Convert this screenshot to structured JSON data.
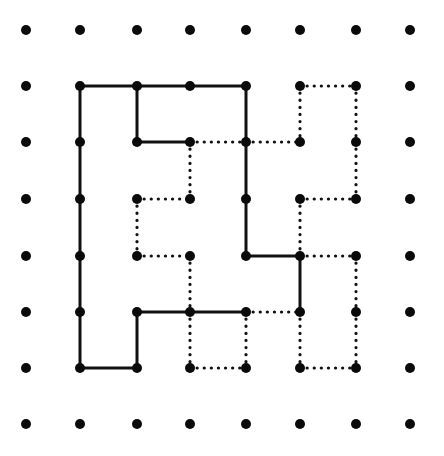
{
  "diagram": {
    "type": "dot-grid-polyomino-dissection",
    "colors": {
      "background": "#ffffff",
      "ink": "#111111",
      "dot": "#0a0a0a"
    },
    "grid": {
      "columns": 8,
      "rows": 8,
      "x": [
        26,
        80,
        137,
        190,
        246,
        300,
        356,
        410
      ],
      "y": [
        30,
        86,
        142,
        199,
        256,
        312,
        368,
        424
      ],
      "dot_radius": 5
    },
    "solid_edges": [
      [
        [
          1,
          1
        ],
        [
          2,
          1
        ]
      ],
      [
        [
          2,
          1
        ],
        [
          3,
          1
        ]
      ],
      [
        [
          3,
          1
        ],
        [
          4,
          1
        ]
      ],
      [
        [
          2,
          1
        ],
        [
          2,
          2
        ]
      ],
      [
        [
          2,
          2
        ],
        [
          3,
          2
        ]
      ],
      [
        [
          4,
          1
        ],
        [
          4,
          2
        ]
      ],
      [
        [
          4,
          2
        ],
        [
          4,
          3
        ]
      ],
      [
        [
          4,
          3
        ],
        [
          4,
          4
        ]
      ],
      [
        [
          4,
          4
        ],
        [
          5,
          4
        ]
      ],
      [
        [
          5,
          4
        ],
        [
          5,
          5
        ]
      ],
      [
        [
          2,
          5
        ],
        [
          3,
          5
        ]
      ],
      [
        [
          3,
          5
        ],
        [
          4,
          5
        ]
      ],
      [
        [
          2,
          5
        ],
        [
          2,
          6
        ]
      ],
      [
        [
          1,
          6
        ],
        [
          2,
          6
        ]
      ],
      [
        [
          1,
          1
        ],
        [
          1,
          2
        ]
      ],
      [
        [
          1,
          2
        ],
        [
          1,
          3
        ]
      ],
      [
        [
          1,
          3
        ],
        [
          1,
          4
        ]
      ],
      [
        [
          1,
          4
        ],
        [
          1,
          5
        ]
      ],
      [
        [
          1,
          5
        ],
        [
          1,
          6
        ]
      ]
    ],
    "dotted_edges": [
      [
        [
          3,
          2
        ],
        [
          4,
          2
        ]
      ],
      [
        [
          4,
          2
        ],
        [
          5,
          2
        ]
      ],
      [
        [
          5,
          1
        ],
        [
          5,
          2
        ]
      ],
      [
        [
          5,
          1
        ],
        [
          6,
          1
        ]
      ],
      [
        [
          6,
          1
        ],
        [
          6,
          2
        ]
      ],
      [
        [
          6,
          2
        ],
        [
          6,
          3
        ]
      ],
      [
        [
          5,
          3
        ],
        [
          6,
          3
        ]
      ],
      [
        [
          5,
          3
        ],
        [
          5,
          4
        ]
      ],
      [
        [
          5,
          4
        ],
        [
          6,
          4
        ]
      ],
      [
        [
          6,
          4
        ],
        [
          6,
          5
        ]
      ],
      [
        [
          6,
          5
        ],
        [
          6,
          6
        ]
      ],
      [
        [
          5,
          6
        ],
        [
          6,
          6
        ]
      ],
      [
        [
          5,
          5
        ],
        [
          5,
          6
        ]
      ],
      [
        [
          4,
          5
        ],
        [
          5,
          5
        ]
      ],
      [
        [
          3,
          2
        ],
        [
          3,
          3
        ]
      ],
      [
        [
          2,
          3
        ],
        [
          3,
          3
        ]
      ],
      [
        [
          2,
          3
        ],
        [
          2,
          4
        ]
      ],
      [
        [
          2,
          4
        ],
        [
          3,
          4
        ]
      ],
      [
        [
          3,
          4
        ],
        [
          3,
          5
        ]
      ],
      [
        [
          3,
          5
        ],
        [
          3,
          6
        ]
      ],
      [
        [
          3,
          6
        ],
        [
          4,
          6
        ]
      ],
      [
        [
          4,
          5
        ],
        [
          4,
          6
        ]
      ]
    ]
  }
}
